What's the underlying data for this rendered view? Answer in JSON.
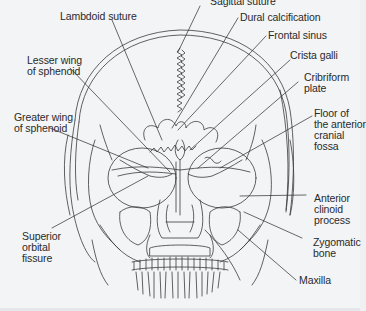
{
  "figure": {
    "line_color": "#3a3a3a",
    "background": "#f3f4f6"
  },
  "labels": {
    "sagittal_suture": "Sagittal suture",
    "lambdoid_suture": "Lambdoid suture",
    "dural_calcification": "Dural calcification",
    "frontal_sinus": "Frontal sinus",
    "lesser_wing": "Lesser wing\nof sphenoid",
    "crista_galli": "Crista galli",
    "cribriform_plate": "Cribriform\nplate",
    "greater_wing": "Greater wing\nof sphenoid",
    "floor_anterior_fossa": "Floor of\nthe anterior\ncranial\nfossa",
    "anterior_clinoid": "Anterior\nclinoid\nprocess",
    "superior_orbital_fissure": "Superior\norbital\nfissure",
    "zygomatic_bone": "Zygomatic\nbone",
    "maxilla": "Maxilla"
  }
}
